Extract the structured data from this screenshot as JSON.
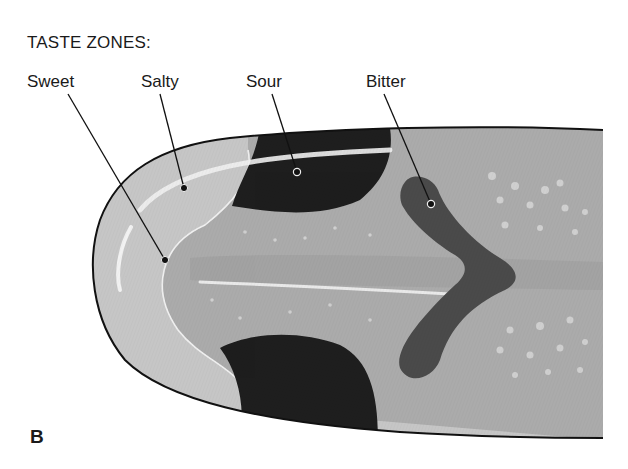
{
  "title": "TASTE ZONES:",
  "labels": {
    "sweet": "Sweet",
    "salty": "Salty",
    "sour": "Sour",
    "bitter": "Bitter"
  },
  "panel_letter": "B",
  "colors": {
    "tongue_outline": "#111111",
    "sweet_salty_zone": "#c4c4c4",
    "tongue_body": "#ababab",
    "sour_zone": "#1e1e1e",
    "bitter_zone": "#4a4a4a",
    "highlight": "#f2f2f2"
  }
}
